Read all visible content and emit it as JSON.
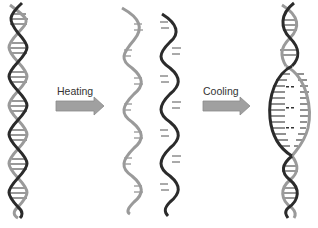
{
  "diagram": {
    "steps": [
      {
        "id": "double-helix",
        "description": "Double-stranded DNA"
      },
      {
        "id": "heating",
        "label": "Heating"
      },
      {
        "id": "single-strands",
        "description": "Two separated single strands"
      },
      {
        "id": "cooling",
        "label": "Cooling"
      },
      {
        "id": "reannealed",
        "description": "Re-annealed double helix with partially paired bubble region"
      }
    ],
    "colors": {
      "strand_dark": "#2b2b2b",
      "strand_light": "#9a9a9a",
      "arrow_fill": "#a0a0a0",
      "arrow_stroke": "#8a8a8a",
      "rung": "#555555",
      "background": "#ffffff"
    }
  }
}
